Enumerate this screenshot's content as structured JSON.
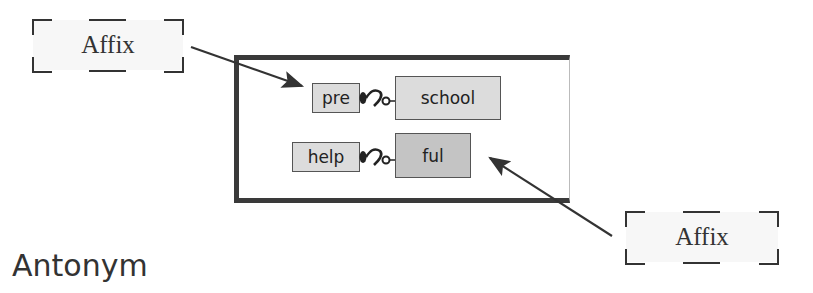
{
  "diagram": {
    "top_label": {
      "text": "Affix"
    },
    "bottom_label": {
      "text": "Affix"
    },
    "rows": [
      {
        "affix": "pre",
        "root": "school"
      },
      {
        "root": "help",
        "affix": "ful"
      }
    ],
    "caption": "Antonym",
    "colors": {
      "frame": "#3a3a3a",
      "box_light": "#dcdcdc",
      "box_dark": "#c4c4c4",
      "arrow": "#333333",
      "label_bg": "#f7f7f7"
    }
  }
}
